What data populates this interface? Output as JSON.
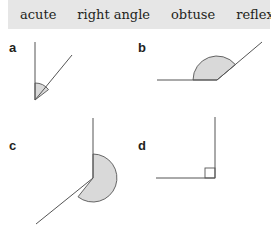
{
  "word_bank": [
    "acute",
    "right angle",
    "obtuse",
    "reflex"
  ],
  "figures": [
    {
      "label": "a",
      "angle_type": "acute"
    },
    {
      "label": "b",
      "angle_type": "obtuse"
    },
    {
      "label": "c",
      "angle_type": "reflex"
    },
    {
      "label": "d",
      "angle_type": "right angle"
    }
  ],
  "colors": {
    "banner_bg": "#e6e6e6",
    "line": "#555555",
    "fill": "#d9d9d9"
  }
}
